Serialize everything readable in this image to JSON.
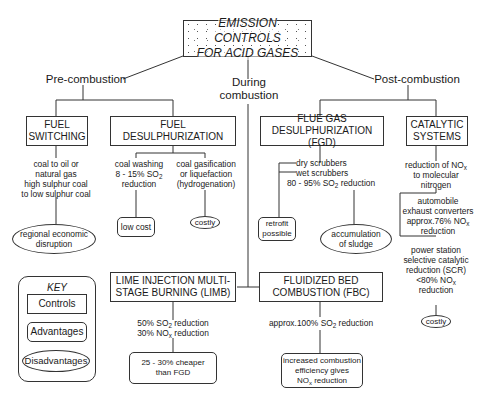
{
  "title": "EMISSION CONTROLS FOR ACID GASES",
  "title_lines": [
    "EMISSION CONTROLS",
    "FOR ACID GASES"
  ],
  "branches": {
    "pre": "Pre-combustion",
    "during_l1": "During",
    "during_l2": "combustion",
    "post": "Post-combustion"
  },
  "controls": {
    "fuel_switching": [
      "FUEL",
      "SWITCHING"
    ],
    "fuel_desulph": [
      "FUEL",
      "DESULPHURIZATION"
    ],
    "fgd": [
      "FLUE GAS",
      "DESULPHURIZATION (FGD)"
    ],
    "catalytic": [
      "CATALYTIC",
      "SYSTEMS"
    ],
    "limb": [
      "LIME INJECTION MULTI-",
      "STAGE BURNING (LIMB)"
    ],
    "fbc": [
      "FLUIDIZED BED",
      "COMBUSTION (FBC)"
    ]
  },
  "notes": {
    "fuel_switching": [
      "coal to oil or",
      "natural gas",
      "high sulphur coal",
      "to low sulphur coal"
    ],
    "coal_washing": [
      "coal washing",
      "8 - 15% SO",
      "2",
      " reduction",
      "reduction"
    ],
    "coal_gasification": [
      "coal gasification",
      "or liquefaction",
      "(hydrogenation)"
    ],
    "fgd_dry": "dry scrubbers",
    "fgd_wet": "wet scrubbers",
    "fgd_reduction": [
      "80 - 95% SO",
      "2",
      " reduction"
    ],
    "catalytic_reduction": [
      "reduction of NO",
      "x",
      "to molecular",
      "nitrogen"
    ],
    "automobile": [
      "automobile",
      "exhaust converters",
      "approx.76% NO",
      "x",
      "reduction"
    ],
    "power_station": [
      "power station",
      "selective catalytic",
      "reduction (SCR)",
      "<80% NO",
      "x",
      "reduction"
    ],
    "limb_so2": [
      "50%  SO",
      "2",
      " reduction"
    ],
    "limb_nox": [
      "30% NO",
      "x",
      " reduction"
    ],
    "fbc_so2": [
      "approx.100%  SO",
      "2",
      " reduction"
    ]
  },
  "advantages": {
    "low_cost": "low cost",
    "retrofit": [
      "retrofit",
      "possible"
    ],
    "limb_cheaper": [
      "25 - 30% cheaper",
      "than FGD"
    ],
    "fbc_efficiency": [
      "increased combustion",
      "efficiency gives",
      "NO",
      "x",
      " reduction"
    ]
  },
  "disadvantages": {
    "regional": [
      "regional economic",
      "disruption"
    ],
    "costly_gasification": "costly",
    "sludge": [
      "accumulation",
      "of sludge"
    ],
    "costly_scr": "costly"
  },
  "key": {
    "title": "KEY",
    "controls": "Controls",
    "advantages": "Advantages",
    "disadvantages": "Disadvantages"
  },
  "colors": {
    "line": "#333333",
    "background": "#ffffff",
    "text": "#1a1a1a"
  }
}
